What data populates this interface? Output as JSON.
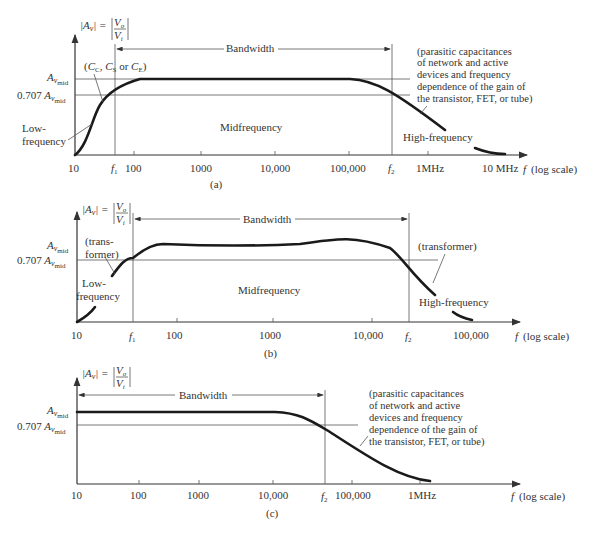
{
  "figures": [
    {
      "id": "a",
      "caption": "(a)",
      "y_label": "|A_v| = |V_o / V_i|",
      "y_ticks": [
        "A_v_mid",
        "0.707 A_v_mid"
      ],
      "x_ticks": [
        "10",
        "f1",
        "100",
        "1000",
        "10,000",
        "100,000",
        "f2",
        "1MHz",
        "10 MHz"
      ],
      "x_axis_label": "f (log scale)",
      "bandwidth_label": "Bandwidth",
      "annotations": {
        "low_cause": "(C_C, C_S or C_E)",
        "low_region": [
          "Low-",
          "frequency"
        ],
        "mid_region": "Midfrequency",
        "high_region": "High-frequency",
        "high_cause": [
          "(parasitic capacitances",
          "of network and active",
          "devices and frequency",
          "dependence of the gain of",
          "the transistor, FET, or tube)"
        ]
      }
    },
    {
      "id": "b",
      "caption": "(b)",
      "y_label": "|A_v| = |V_o / V_i|",
      "y_ticks": [
        "A_v_mid",
        "0.707 A_v_mid"
      ],
      "x_ticks": [
        "10",
        "f1",
        "100",
        "1000",
        "10,000",
        "f2",
        "100,000"
      ],
      "x_axis_label": "f (log scale)",
      "bandwidth_label": "Bandwidth",
      "annotations": {
        "low_cause": [
          "(trans-",
          "former)"
        ],
        "low_region": [
          "Low-",
          "frequency"
        ],
        "mid_region": "Midfrequency",
        "high_region": "High-frequency",
        "high_cause": "(transformer)"
      }
    },
    {
      "id": "c",
      "caption": "(c)",
      "y_label": "|A_v| = |V_o / V_i|",
      "y_ticks": [
        "A_v_mid",
        "0.707 A_v_mid"
      ],
      "x_ticks": [
        "10",
        "100",
        "1000",
        "10,000",
        "f2",
        "100,000",
        "1MHz"
      ],
      "x_axis_label": "f (log scale)",
      "bandwidth_label": "Bandwidth",
      "annotations": {
        "high_cause": [
          "(parasitic capacitances",
          "of network and active",
          "devices and frequency",
          "dependence of the gain of",
          "the transistor, FET, or tube)"
        ]
      }
    }
  ],
  "text": {
    "a_caption": "(a)",
    "b_caption": "(b)",
    "c_caption": "(c)",
    "bandwidth": "Bandwidth",
    "midfrequency": "Midfrequency",
    "high_frequency": "High-frequency",
    "low": "Low-",
    "frequency": "frequency",
    "flog": "(log scale)",
    "f": "f",
    "avmid_prefix": "0.707",
    "a_low_cause": "(C",
    "parasitic": [
      "(parasitic capacitances",
      "of network and active",
      "devices and frequency",
      "dependence of the gain of",
      "the transistor, FET, or tube)"
    ],
    "trans1": "(trans-",
    "trans2": "former)",
    "transformer": "(transformer)",
    "ticks_a": [
      "10",
      "100",
      "1000",
      "10,000",
      "100,000",
      "1MHz",
      "10 MHz"
    ],
    "ticks_b": [
      "10",
      "100",
      "1000",
      "10,000",
      "100,000"
    ],
    "ticks_c": [
      "10",
      "100",
      "1000",
      "10,000",
      "100,000",
      "1MHz"
    ]
  }
}
